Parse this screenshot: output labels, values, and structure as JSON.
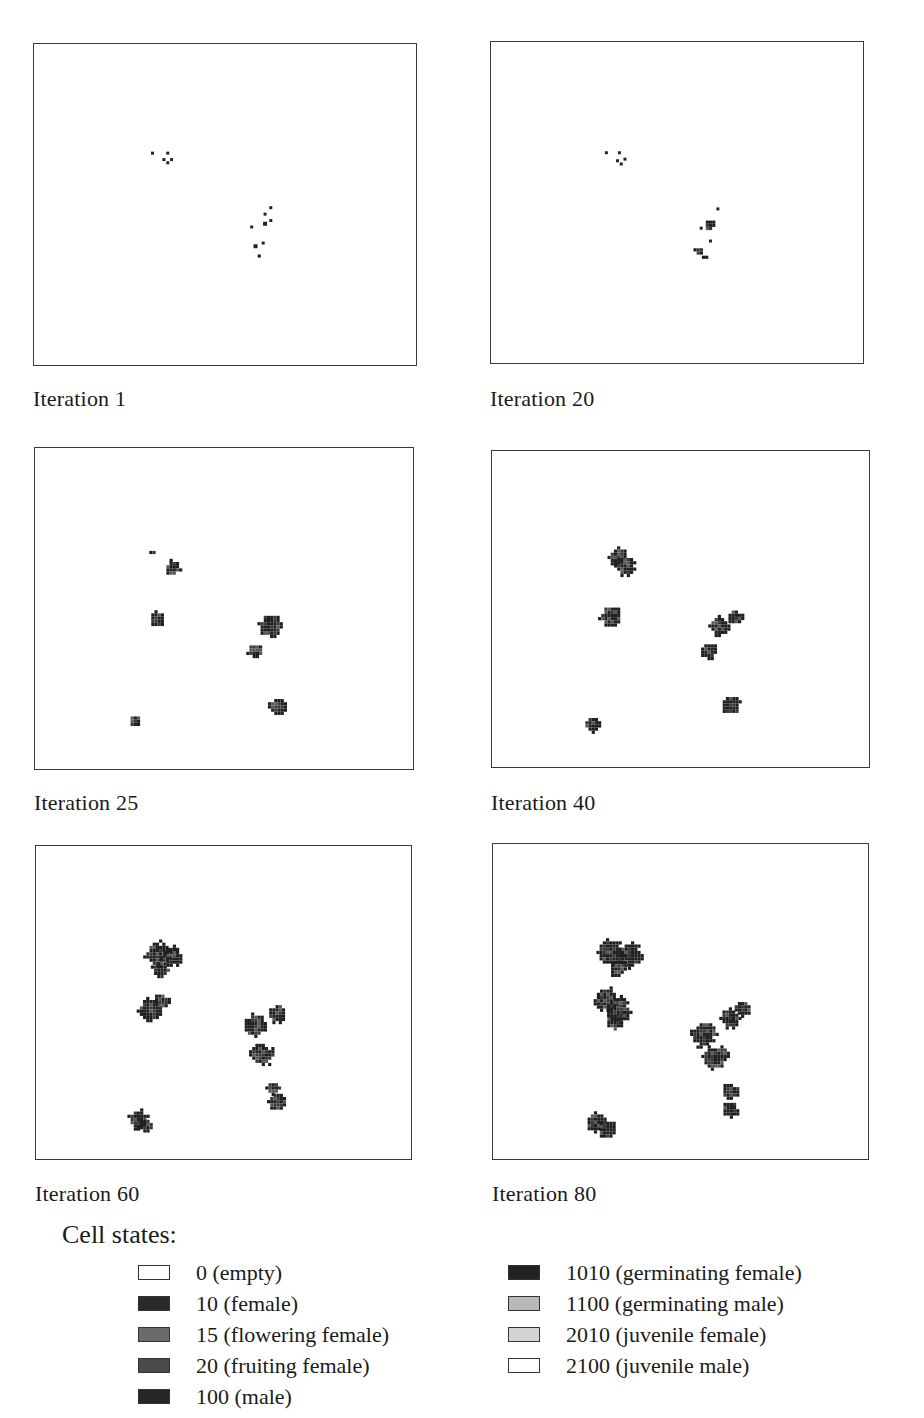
{
  "figure": {
    "panels": [
      {
        "id": "p1",
        "caption": "Iteration 1",
        "frame": {
          "x": 33,
          "y": 43,
          "w": 384,
          "h": 323
        },
        "caption_pos": {
          "x": 33,
          "y": 386
        }
      },
      {
        "id": "p2",
        "caption": "Iteration 20",
        "frame": {
          "x": 490,
          "y": 41,
          "w": 374,
          "h": 323
        },
        "caption_pos": {
          "x": 490,
          "y": 386
        }
      },
      {
        "id": "p3",
        "caption": "Iteration 25",
        "frame": {
          "x": 34,
          "y": 447,
          "w": 380,
          "h": 323
        },
        "caption_pos": {
          "x": 34,
          "y": 790
        }
      },
      {
        "id": "p4",
        "caption": "Iteration 40",
        "frame": {
          "x": 491,
          "y": 450,
          "w": 379,
          "h": 318
        },
        "caption_pos": {
          "x": 491,
          "y": 790
        }
      },
      {
        "id": "p5",
        "caption": "Iteration 60",
        "frame": {
          "x": 35,
          "y": 845,
          "w": 377,
          "h": 315
        },
        "caption_pos": {
          "x": 35,
          "y": 1181
        }
      },
      {
        "id": "p6",
        "caption": "Iteration 80",
        "frame": {
          "x": 492,
          "y": 843,
          "w": 377,
          "h": 317
        },
        "caption_pos": {
          "x": 492,
          "y": 1181
        }
      }
    ],
    "legend": {
      "title": "Cell states:",
      "left_column": [
        {
          "label": "0 (empty)",
          "color": "#ffffff"
        },
        {
          "label": "10 (female)",
          "color": "#2a2a2a"
        },
        {
          "label": "15 (flowering female)",
          "color": "#6a6a6a"
        },
        {
          "label": "20 (fruiting female)",
          "color": "#4a4a4a"
        },
        {
          "label": "100 (male)",
          "color": "#262626"
        }
      ],
      "right_column": [
        {
          "label": "1010 (germinating female)",
          "color": "#222222"
        },
        {
          "label": "1100 (germinating male)",
          "color": "#b8b8b8"
        },
        {
          "label": "2010 (juvenile female)",
          "color": "#d4d4d4"
        },
        {
          "label": "2100 (juvenile male)",
          "color": "#ffffff"
        }
      ]
    }
  },
  "clusters": {
    "p1": [
      {
        "x": 0.31,
        "y": 0.34,
        "r": 1.5
      },
      {
        "x": 0.35,
        "y": 0.34,
        "r": 1.5
      },
      {
        "x": 0.34,
        "y": 0.36,
        "r": 1.5
      },
      {
        "x": 0.36,
        "y": 0.36,
        "r": 1.5
      },
      {
        "x": 0.35,
        "y": 0.37,
        "r": 1.5
      },
      {
        "x": 0.62,
        "y": 0.51,
        "r": 1.5
      },
      {
        "x": 0.605,
        "y": 0.53,
        "r": 1.5
      },
      {
        "x": 0.605,
        "y": 0.56,
        "r": 2
      },
      {
        "x": 0.62,
        "y": 0.55,
        "r": 1.5
      },
      {
        "x": 0.57,
        "y": 0.57,
        "r": 1.5
      },
      {
        "x": 0.6,
        "y": 0.62,
        "r": 1.5
      },
      {
        "x": 0.58,
        "y": 0.63,
        "r": 2
      },
      {
        "x": 0.585,
        "y": 0.655,
        "r": 3
      }
    ],
    "p2": [
      {
        "x": 0.31,
        "y": 0.345,
        "r": 1.5
      },
      {
        "x": 0.345,
        "y": 0.345,
        "r": 1.5
      },
      {
        "x": 0.34,
        "y": 0.37,
        "r": 1.5
      },
      {
        "x": 0.36,
        "y": 0.365,
        "r": 1.5
      },
      {
        "x": 0.35,
        "y": 0.38,
        "r": 1.5
      },
      {
        "x": 0.61,
        "y": 0.52,
        "r": 1.5
      },
      {
        "x": 0.585,
        "y": 0.565,
        "r": 6
      },
      {
        "x": 0.565,
        "y": 0.58,
        "r": 1.5
      },
      {
        "x": 0.59,
        "y": 0.62,
        "r": 1.5
      },
      {
        "x": 0.555,
        "y": 0.645,
        "r": 4
      },
      {
        "x": 0.575,
        "y": 0.665,
        "r": 3
      }
    ],
    "p3": [
      {
        "x": 0.31,
        "y": 0.32,
        "r": 3
      },
      {
        "x": 0.36,
        "y": 0.37,
        "r": 8
      },
      {
        "x": 0.32,
        "y": 0.53,
        "r": 8
      },
      {
        "x": 0.62,
        "y": 0.55,
        "r": 12
      },
      {
        "x": 0.58,
        "y": 0.63,
        "r": 8
      },
      {
        "x": 0.64,
        "y": 0.8,
        "r": 9
      },
      {
        "x": 0.26,
        "y": 0.845,
        "r": 6
      }
    ],
    "p4": [
      {
        "x": 0.33,
        "y": 0.33,
        "r": 9
      },
      {
        "x": 0.35,
        "y": 0.36,
        "r": 10
      },
      {
        "x": 0.31,
        "y": 0.52,
        "r": 11
      },
      {
        "x": 0.6,
        "y": 0.55,
        "r": 10
      },
      {
        "x": 0.64,
        "y": 0.52,
        "r": 8
      },
      {
        "x": 0.57,
        "y": 0.63,
        "r": 9
      },
      {
        "x": 0.63,
        "y": 0.8,
        "r": 10
      },
      {
        "x": 0.26,
        "y": 0.86,
        "r": 8
      }
    ],
    "p5": [
      {
        "x": 0.32,
        "y": 0.34,
        "r": 13
      },
      {
        "x": 0.36,
        "y": 0.35,
        "r": 11
      },
      {
        "x": 0.33,
        "y": 0.39,
        "r": 9
      },
      {
        "x": 0.3,
        "y": 0.52,
        "r": 12
      },
      {
        "x": 0.33,
        "y": 0.49,
        "r": 8
      },
      {
        "x": 0.58,
        "y": 0.57,
        "r": 12
      },
      {
        "x": 0.64,
        "y": 0.53,
        "r": 10
      },
      {
        "x": 0.6,
        "y": 0.66,
        "r": 12
      },
      {
        "x": 0.64,
        "y": 0.81,
        "r": 9
      },
      {
        "x": 0.63,
        "y": 0.77,
        "r": 7
      },
      {
        "x": 0.27,
        "y": 0.87,
        "r": 10
      },
      {
        "x": 0.29,
        "y": 0.89,
        "r": 8
      }
    ],
    "p6": [
      {
        "x": 0.31,
        "y": 0.34,
        "r": 13
      },
      {
        "x": 0.36,
        "y": 0.35,
        "r": 13
      },
      {
        "x": 0.33,
        "y": 0.39,
        "r": 9
      },
      {
        "x": 0.3,
        "y": 0.49,
        "r": 12
      },
      {
        "x": 0.33,
        "y": 0.52,
        "r": 13
      },
      {
        "x": 0.32,
        "y": 0.56,
        "r": 9
      },
      {
        "x": 0.56,
        "y": 0.6,
        "r": 13
      },
      {
        "x": 0.63,
        "y": 0.55,
        "r": 10
      },
      {
        "x": 0.66,
        "y": 0.52,
        "r": 9
      },
      {
        "x": 0.59,
        "y": 0.67,
        "r": 13
      },
      {
        "x": 0.63,
        "y": 0.78,
        "r": 9
      },
      {
        "x": 0.63,
        "y": 0.84,
        "r": 9
      },
      {
        "x": 0.27,
        "y": 0.88,
        "r": 10
      },
      {
        "x": 0.3,
        "y": 0.9,
        "r": 9
      }
    ]
  }
}
